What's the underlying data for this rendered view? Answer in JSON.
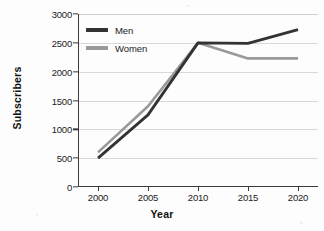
{
  "chart_data": {
    "type": "line",
    "title": "",
    "xlabel": "Year",
    "ylabel": "Subscribers",
    "x": [
      2000,
      2005,
      2010,
      2015,
      2020
    ],
    "categories": [
      "2000",
      "2005",
      "2010",
      "2015",
      "2020"
    ],
    "series": [
      {
        "name": "Men",
        "values": [
          500,
          1250,
          2500,
          2490,
          2730
        ],
        "color": "#333333"
      },
      {
        "name": "Women",
        "values": [
          600,
          1400,
          2500,
          2230,
          2230
        ],
        "color": "#999999"
      }
    ],
    "ylim": [
      0,
      3000
    ],
    "xlim": [
      1998,
      2022
    ],
    "y_ticks": [
      0,
      500,
      1000,
      1500,
      2000,
      2500,
      3000
    ],
    "y_tick_labels": [
      "0",
      "500",
      "1000",
      "1500",
      "2000",
      "2500",
      "3000"
    ],
    "x_ticks": [
      2000,
      2005,
      2010,
      2015,
      2020
    ],
    "x_tick_labels": [
      "2000",
      "2005",
      "2010",
      "2015",
      "2020"
    ],
    "grid": true,
    "grid_axis": "y",
    "legend_position": "upper left",
    "legend": [
      "Men",
      "Women"
    ]
  },
  "axes": {
    "y_title": "Subscribers",
    "x_title": "Year"
  },
  "colors": {
    "men_line": "#333333",
    "women_line": "#999999",
    "grid": "#d8d8d8",
    "axis": "#3a3a3a",
    "background": "#fdfdfd",
    "text": "#1c1c1c"
  }
}
